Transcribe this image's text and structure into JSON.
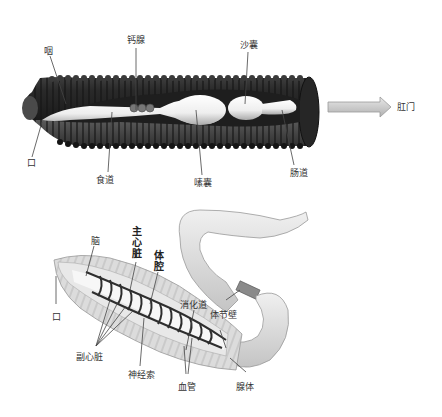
{
  "top_diagram": {
    "title": "蚯蚓消化系统",
    "labels": {
      "pharynx": "咽",
      "calciferous_gland": "钙腺",
      "gizzard": "沙囊",
      "anus": "肛门",
      "mouth": "口",
      "esophagus": "食道",
      "crop": "嗉囊",
      "intestine": "肠道"
    }
  },
  "bottom_diagram": {
    "title": "蚯蚓内部结构",
    "labels": {
      "brain": "脑",
      "main_heart": "主心脏",
      "coelom": "体腔",
      "mouth": "口",
      "digestive_tract": "消化道",
      "segment_wall": "体节壁",
      "accessory_hearts": "副心脏",
      "nerve_cord": "神经索",
      "blood_vessels": "血管",
      "gland": "腺体"
    }
  },
  "colors": {
    "worm_dark": "#2f2f2f",
    "gut_white": "#f4f4f4",
    "arrow_fill": "#c8c8c8",
    "body_light": "#d9d9d9",
    "leader_line": "#444444"
  }
}
